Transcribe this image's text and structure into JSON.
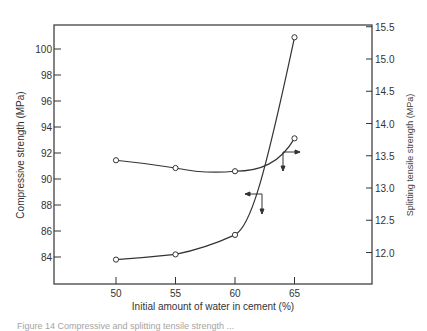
{
  "chart_data": {
    "type": "line",
    "title": "",
    "xlabel": "Initial amount of water in cement (%)",
    "ylabel": "Compressive strength (MPa)",
    "y2label": "Splitting tensile strength (MPa)",
    "x": [
      50,
      55,
      60,
      65
    ],
    "x_ticks": [
      "50",
      "55",
      "60",
      "65"
    ],
    "y_ticks": [
      "84",
      "86",
      "88",
      "90",
      "92",
      "94",
      "96",
      "98",
      "100"
    ],
    "y2_ticks": [
      "12.0",
      "12.5",
      "13.0",
      "13.5",
      "14.0",
      "14.5",
      "15.0",
      "15.5"
    ],
    "ylim": [
      82.3,
      102.5
    ],
    "y2lim": [
      11.5,
      15.5
    ],
    "grid": false,
    "legend": "none (arrows indicate axis)",
    "series": [
      {
        "name": "Compressive strength",
        "axis": "left",
        "values": [
          83.8,
          84.2,
          85.7,
          100.9
        ]
      },
      {
        "name": "Splitting tensile strength",
        "axis": "right",
        "values": [
          13.43,
          13.31,
          13.26,
          13.77
        ]
      }
    ]
  },
  "caption": "Figure 14  Compressive and splitting tensile strength ..."
}
